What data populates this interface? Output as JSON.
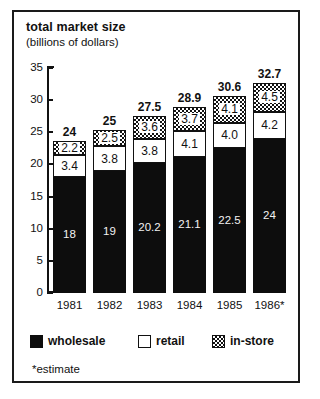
{
  "chart_data": {
    "type": "bar",
    "subtype": "stacked",
    "title": "total market size",
    "subtitle": "(billions of dollars)",
    "xlabel": "",
    "ylabel": "",
    "ylim": [
      0,
      35
    ],
    "yticks": [
      0,
      5,
      10,
      15,
      20,
      25,
      30,
      35
    ],
    "grid": false,
    "legend_position": "bottom",
    "categories": [
      "1981",
      "1982",
      "1983",
      "1984",
      "1985",
      "1986*"
    ],
    "series": [
      {
        "name": "wholesale",
        "values": [
          18,
          19,
          20.2,
          21.1,
          22.5,
          24
        ],
        "labels": [
          "18",
          "19",
          "20.2",
          "21.1",
          "22.5",
          "24"
        ],
        "color": "#0d0d0d"
      },
      {
        "name": "retail",
        "values": [
          3.4,
          3.8,
          3.8,
          4.1,
          4.0,
          4.2
        ],
        "labels": [
          "3.4",
          "3.8",
          "3.8",
          "4.1",
          "4.0",
          "4.2"
        ],
        "color": "#ffffff"
      },
      {
        "name": "in-store",
        "values": [
          2.2,
          2.5,
          3.6,
          3.7,
          4.1,
          4.5
        ],
        "labels": [
          "2.2",
          "2.5",
          "3.6",
          "3.7",
          "4.1",
          "4.5"
        ],
        "color": "checkerboard"
      }
    ],
    "totals": [
      24,
      25,
      27.5,
      28.9,
      30.6,
      32.7
    ],
    "total_labels": [
      "24",
      "25",
      "27.5",
      "28.9",
      "30.6",
      "32.7"
    ],
    "annotations": [
      "*estimate"
    ]
  },
  "legend": {
    "items": [
      {
        "label": "wholesale",
        "swatch": "solid-black"
      },
      {
        "label": "retail",
        "swatch": "outline-white"
      },
      {
        "label": "in-store",
        "swatch": "checkerboard"
      }
    ]
  },
  "footnote": "*estimate",
  "colors": {
    "ink": "#111111",
    "paper": "#ffffff",
    "bar_black": "#0d0d0d"
  }
}
